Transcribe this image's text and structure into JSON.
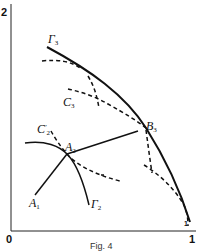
{
  "figure": {
    "caption": "Fig. 4",
    "axes": {
      "y_top_label": "2",
      "origin_label": "0",
      "x_end_label": "1"
    },
    "labels": {
      "gamma3": {
        "main": "Γ",
        "sub": "3"
      },
      "c3": {
        "main": "C",
        "sub": "3"
      },
      "b3": {
        "main": "B",
        "sub": "3"
      },
      "c2prime": {
        "main": "C",
        "sub": "2",
        "sup": "′"
      },
      "a2": {
        "main": "A",
        "sub": "2"
      },
      "a1": {
        "main": "A",
        "sub": "1"
      },
      "gamma2": {
        "main": "Γ",
        "sub": "2"
      },
      "small_1": "1"
    },
    "colors": {
      "ink": "#111111",
      "background": "#ffffff"
    }
  }
}
